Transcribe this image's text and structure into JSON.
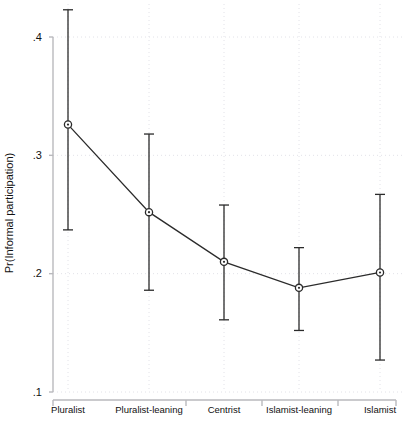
{
  "chart_data": {
    "type": "line",
    "title": "",
    "subtitle": "",
    "xlabel": "",
    "ylabel": "Pr(Informal participation)",
    "categories": [
      "Pluralist",
      "Pluralist-leaning",
      "Centrist",
      "Islamist-leaning",
      "Islamist"
    ],
    "values": [
      0.326,
      0.252,
      0.21,
      0.188,
      0.201
    ],
    "ci_lower": [
      0.237,
      0.186,
      0.161,
      0.152,
      0.127
    ],
    "ci_upper": [
      0.423,
      0.318,
      0.258,
      0.222,
      0.267
    ],
    "series": [
      {
        "name": "Predicted probability",
        "values": [
          0.326,
          0.252,
          0.21,
          0.188,
          0.201
        ],
        "ci_lower": [
          0.237,
          0.186,
          0.161,
          0.152,
          0.127
        ],
        "ci_upper": [
          0.423,
          0.318,
          0.258,
          0.222,
          0.267
        ]
      }
    ],
    "ylim": [
      0.1,
      0.4
    ],
    "yticks": [
      0.1,
      0.2,
      0.3,
      0.4
    ],
    "ytick_labels": [
      ".1",
      ".2",
      ".3",
      ".4"
    ],
    "grid": true,
    "grid_axis": "both",
    "legend": false,
    "legend_position": "none",
    "marker": "circle-open-with-dot",
    "error_bars": "capped-vertical",
    "colors": {
      "line": "#2b2b2b",
      "marker": "#2b2b2b",
      "error_bar": "#2b2b2b",
      "grid": "#e2e2e8",
      "axis": "#b9b9bd",
      "text": "#111111",
      "background": "#ffffff"
    }
  }
}
